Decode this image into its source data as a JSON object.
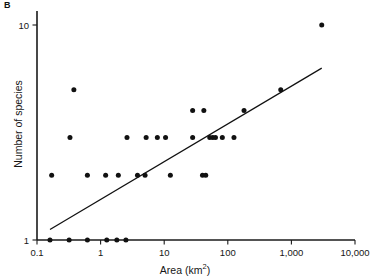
{
  "figure": {
    "panel_label": "B",
    "background_color": "#ffffff",
    "ink_color": "#111111"
  },
  "axes": {
    "x_title_main": "Area (km",
    "x_title_unit": "2",
    "x_title_close": ")",
    "x_title_full": "Area (km2)",
    "y_title": "Number of species",
    "x_tick_labels": [
      "0.1",
      "1",
      "10",
      "100",
      "1,000",
      "10,000"
    ],
    "y_tick_labels": [
      "1",
      "10"
    ]
  },
  "chart_data": {
    "type": "scatter",
    "title": "",
    "subtitle": "",
    "xlabel": "Area (km2)",
    "ylabel": "Number of species",
    "xscale": "log",
    "yscale": "log",
    "xlim": [
      0.1,
      10000
    ],
    "ylim": [
      1,
      10
    ],
    "xticks": [
      0.1,
      1,
      10,
      100,
      1000,
      10000
    ],
    "xticklabels": [
      "0.1",
      "1",
      "10",
      "100",
      "1,000",
      "10,000"
    ],
    "yticks": [
      1,
      10
    ],
    "yticklabels": [
      "1",
      "10"
    ],
    "grid": false,
    "legend": null,
    "annotations": [
      {
        "text": "B",
        "position": "top-left-outside",
        "style": "bold"
      }
    ],
    "series": [
      {
        "name": "Islands",
        "marker": "filled-circle",
        "marker_color": "#111111",
        "marker_size_px": 5,
        "points": [
          {
            "x": 0.16,
            "y": 1
          },
          {
            "x": 0.32,
            "y": 1
          },
          {
            "x": 0.62,
            "y": 1
          },
          {
            "x": 1.25,
            "y": 1
          },
          {
            "x": 1.8,
            "y": 1
          },
          {
            "x": 2.5,
            "y": 1
          },
          {
            "x": 0.17,
            "y": 2
          },
          {
            "x": 0.62,
            "y": 2
          },
          {
            "x": 1.2,
            "y": 2
          },
          {
            "x": 1.9,
            "y": 2
          },
          {
            "x": 3.8,
            "y": 2
          },
          {
            "x": 5.0,
            "y": 2
          },
          {
            "x": 12.5,
            "y": 2
          },
          {
            "x": 40,
            "y": 2
          },
          {
            "x": 45,
            "y": 2
          },
          {
            "x": 0.33,
            "y": 3
          },
          {
            "x": 2.6,
            "y": 3
          },
          {
            "x": 5.2,
            "y": 3
          },
          {
            "x": 7.8,
            "y": 3
          },
          {
            "x": 10.5,
            "y": 3
          },
          {
            "x": 28,
            "y": 3
          },
          {
            "x": 52,
            "y": 3
          },
          {
            "x": 58,
            "y": 3
          },
          {
            "x": 64,
            "y": 3
          },
          {
            "x": 82,
            "y": 3
          },
          {
            "x": 125,
            "y": 3
          },
          {
            "x": 28,
            "y": 4
          },
          {
            "x": 42,
            "y": 4
          },
          {
            "x": 180,
            "y": 4
          },
          {
            "x": 0.38,
            "y": 5
          },
          {
            "x": 680,
            "y": 5
          },
          {
            "x": 3000,
            "y": 10
          }
        ]
      }
    ],
    "fit_line": {
      "name": "Least-squares regression",
      "type": "line",
      "style": "solid",
      "color": "#111111",
      "endpoints": [
        {
          "x": 0.16,
          "y": 1.12
        },
        {
          "x": 3000,
          "y": 6.3
        }
      ]
    }
  }
}
